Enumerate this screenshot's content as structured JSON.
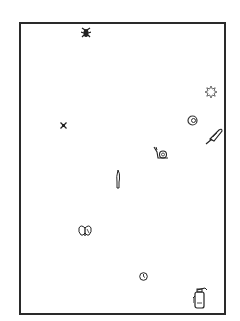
{
  "canvas": {
    "background": "#ffffff",
    "border_color": "#2a2a2a"
  },
  "icons": [
    {
      "name": "bug-icon",
      "x": 81,
      "y": 27
    },
    {
      "name": "sun-icon",
      "x": 205,
      "y": 86
    },
    {
      "name": "moon-icon",
      "x": 187,
      "y": 115
    },
    {
      "name": "feather-icon",
      "x": 204,
      "y": 127
    },
    {
      "name": "star-icon",
      "x": 60,
      "y": 122
    },
    {
      "name": "snail-icon",
      "x": 153,
      "y": 146
    },
    {
      "name": "knife-icon",
      "x": 115,
      "y": 169
    },
    {
      "name": "butterfly-icon",
      "x": 78,
      "y": 225
    },
    {
      "name": "clock-icon",
      "x": 139,
      "y": 272
    },
    {
      "name": "fire-extinguisher-icon",
      "x": 193,
      "y": 287
    }
  ]
}
